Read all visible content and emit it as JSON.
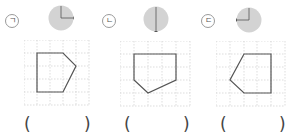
{
  "problems": [
    {
      "label": "ㄱ",
      "rotation": "clockwise 90°",
      "dial_hand": "right",
      "shape_points": "3,1 6,1 7,2 6,4 3,4",
      "answer_open": "(",
      "answer_close": ")"
    },
    {
      "label": "ㄴ",
      "rotation": "180°",
      "dial_hand": "down",
      "shape_points": "2,1 5,1 5,3 2,4 1,3 1,1",
      "answer_open": "(",
      "answer_close": ")"
    },
    {
      "label": "ㄷ",
      "rotation": "counterclockwise 90°",
      "dial_hand": "left",
      "shape_points": "2,1 5,1 5,4 2,4 1,3",
      "answer_open": "(",
      "answer_close": ")"
    }
  ],
  "colors": {
    "dial_fill": "#d3d3d3",
    "shape_stroke": "#555555",
    "grid_dots": "#bdbdbd"
  }
}
